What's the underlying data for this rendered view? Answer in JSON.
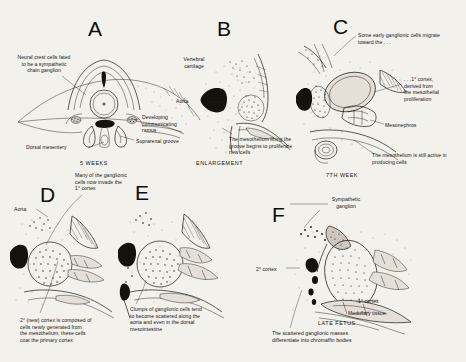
{
  "figure": {
    "background_color": "#f2f1ec",
    "ink_color": "#15120e",
    "style": "pen-and-ink stipple anatomical illustration"
  },
  "panels": [
    {
      "id": "A",
      "letter": "A",
      "stage": "5 WEEKS",
      "labels": [
        {
          "name": "neural-crest-cells",
          "text": "Neural crest cells fated\nto be a sympathetic\nchain ganglion"
        },
        {
          "name": "dorsal-mesentery",
          "text": "Dorsal mesentery"
        },
        {
          "name": "developing-communicating-ramus",
          "text": "Developing\n    communicating\n    ramus"
        },
        {
          "name": "suprarenal-groove",
          "text": "Suprarenal groove"
        }
      ]
    },
    {
      "id": "B",
      "letter": "B",
      "stage": "ENLARGEMENT",
      "labels": [
        {
          "name": "vertebral-cartilage",
          "text": "Vertebral\ncartilage"
        },
        {
          "name": "aorta",
          "text": "Aorta"
        },
        {
          "name": "mesothelium-proliferation",
          "text": "The mesothelium lining the\ngroove begins to proliferate\nnew cells"
        }
      ]
    },
    {
      "id": "C",
      "letter": "C",
      "stage": "7TH WEEK",
      "labels": [
        {
          "name": "early-ganglionic-cells-migrate",
          "text": "Some early ganglionic cells migrate\n    toward the . . ."
        },
        {
          "name": "primary-cortex",
          "text": ". . .1° cortex,\nderived from\nthe mesothelial\nproliferation"
        },
        {
          "name": "mesonephros",
          "text": "Mesonephros"
        },
        {
          "name": "mesothelium-still-active",
          "text": "The mesothelium is still active in\n    producing cells"
        }
      ]
    },
    {
      "id": "D",
      "letter": "D",
      "stage": "",
      "labels": [
        {
          "name": "aorta",
          "text": "Aorta"
        },
        {
          "name": "ganglionic-cells-invade",
          "text": "Many of the ganglionic\n  cells now invade the\n      1° cortex"
        },
        {
          "name": "secondary-cortex",
          "text": "2° (new) cortex is composed of\ncells newly generated from\nthe mesothelium; these cells\ncoat the primary cortex"
        }
      ]
    },
    {
      "id": "E",
      "letter": "E",
      "stage": "",
      "labels": [
        {
          "name": "ganglionic-clumps-scatter",
          "text": "Clumps of ganglionic cells tend\n   to become scattered along the\n   aorta and even in the dorsal\n   mesointestine"
        }
      ]
    },
    {
      "id": "F",
      "letter": "F",
      "stage": "LATE FETUS",
      "labels": [
        {
          "name": "sympathetic-ganglion",
          "text": "Sympathetic\n ganglion"
        },
        {
          "name": "secondary-cortex",
          "text": "2° cortex"
        },
        {
          "name": "primary-cortex",
          "text": "1° cortex"
        },
        {
          "name": "medullary-tissue",
          "text": "Medullary tissue"
        },
        {
          "name": "chromaffin-bodies",
          "text": "The scattered ganglionic masses\n   differentiate into chromaffin bodies"
        }
      ]
    }
  ]
}
